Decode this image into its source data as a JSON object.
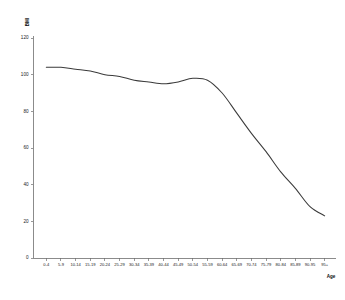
{
  "chart_data": {
    "type": "line",
    "title": "",
    "xlabel": "Age",
    "ylabel": "BMI",
    "ylim": [
      0,
      120
    ],
    "ytick_values": [
      0,
      20,
      40,
      60,
      80,
      100,
      120
    ],
    "ytick_labels": [
      "0",
      "20",
      "40",
      "60",
      "80",
      "100",
      "120"
    ],
    "grid": false,
    "legend": false,
    "categories": [
      "0-4",
      "5-9",
      "10-14",
      "15-19",
      "20-24",
      "25-29",
      "30-34",
      "35-39",
      "40-44",
      "45-49",
      "50-54",
      "55-59",
      "60-64",
      "65-69",
      "70-74",
      "75-79",
      "80-84",
      "85-89",
      "90-95",
      "95+"
    ],
    "series": [
      {
        "name": "BMI",
        "values": [
          104,
          104,
          103,
          102,
          100,
          99,
          97,
          96,
          95,
          96,
          98,
          97,
          90,
          79,
          68,
          58,
          47,
          38,
          28,
          23
        ]
      }
    ]
  }
}
